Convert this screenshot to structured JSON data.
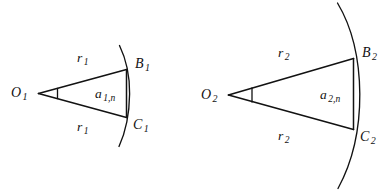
{
  "figure": {
    "caption_text": "",
    "background_color": "#ffffff",
    "stroke_color": "#121212",
    "sectors": [
      {
        "id": "sector-1",
        "vertex_label": "O",
        "vertex_sub": "1",
        "radius_label_upper": "r",
        "radius_sub_upper": "1",
        "radius_label_lower": "r",
        "radius_sub_lower": "1",
        "chord_label": "a",
        "chord_sub": "1,n",
        "arc_top_label": "B",
        "arc_top_sub": "1",
        "arc_bottom_label": "C",
        "arc_bottom_sub": "1"
      },
      {
        "id": "sector-2",
        "vertex_label": "O",
        "vertex_sub": "2",
        "radius_label_upper": "r",
        "radius_sub_upper": "2",
        "radius_label_lower": "r",
        "radius_sub_lower": "2",
        "chord_label": "a",
        "chord_sub": "2,n",
        "arc_top_label": "B",
        "arc_top_sub": "2",
        "arc_bottom_label": "C",
        "arc_bottom_sub": "2"
      }
    ]
  }
}
